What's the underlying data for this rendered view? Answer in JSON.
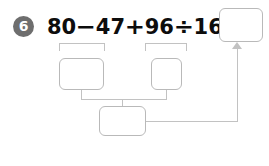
{
  "problem": {
    "number": "6",
    "equation": {
      "full_text": "80 − 47 + 96 ÷ 16 =",
      "tokens": [
        {
          "type": "number",
          "text": "80"
        },
        {
          "type": "operator",
          "text": "−"
        },
        {
          "type": "number",
          "text": "47"
        },
        {
          "type": "operator",
          "text": "+"
        },
        {
          "type": "number",
          "text": "96"
        },
        {
          "type": "operator",
          "text": "÷"
        },
        {
          "type": "number",
          "text": "16"
        },
        {
          "type": "operator",
          "text": "="
        }
      ]
    }
  },
  "answer_box": {
    "value": "",
    "placeholder": ""
  },
  "work_boxes": [
    {
      "id": "left",
      "value": "",
      "placeholder": "",
      "groups": "80 − 47"
    },
    {
      "id": "right",
      "value": "",
      "placeholder": "",
      "groups": "96 ÷ 16"
    },
    {
      "id": "bottom",
      "value": "",
      "placeholder": "",
      "groups": "sum of the two partial results"
    }
  ],
  "brackets": [
    {
      "id": "left",
      "spans": "80 − 47"
    },
    {
      "id": "right",
      "spans": "96 ÷ 16"
    }
  ],
  "colors": {
    "badge_fill": "#6e6e6e",
    "badge_text": "#ffffff",
    "equation_text": "#0d0d0d",
    "box_border": "#b9b9b9",
    "connector": "#c2c2c2",
    "background": "#ffffff"
  }
}
